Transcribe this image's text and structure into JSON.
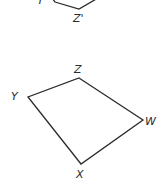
{
  "figure": {
    "background": "#ffffff",
    "stroke_color": "#2b2b2b",
    "top_shape": {
      "name": "partial-image-quadrilateral",
      "labels": {
        "Y": "Y'",
        "Z": "Z'"
      },
      "points": [
        [
          52,
          -2
        ],
        [
          55,
          2
        ],
        [
          79,
          9
        ],
        [
          98,
          -2
        ]
      ]
    },
    "bottom_shape": {
      "name": "quadrilateral-WXYZ",
      "vertices": {
        "Z": [
          79,
          78
        ],
        "W": [
          143,
          120
        ],
        "X": [
          81,
          164
        ],
        "Y": [
          28,
          97
        ]
      },
      "labels": {
        "Z": "Z",
        "W": "W",
        "X": "X",
        "Y": "Y"
      }
    }
  }
}
